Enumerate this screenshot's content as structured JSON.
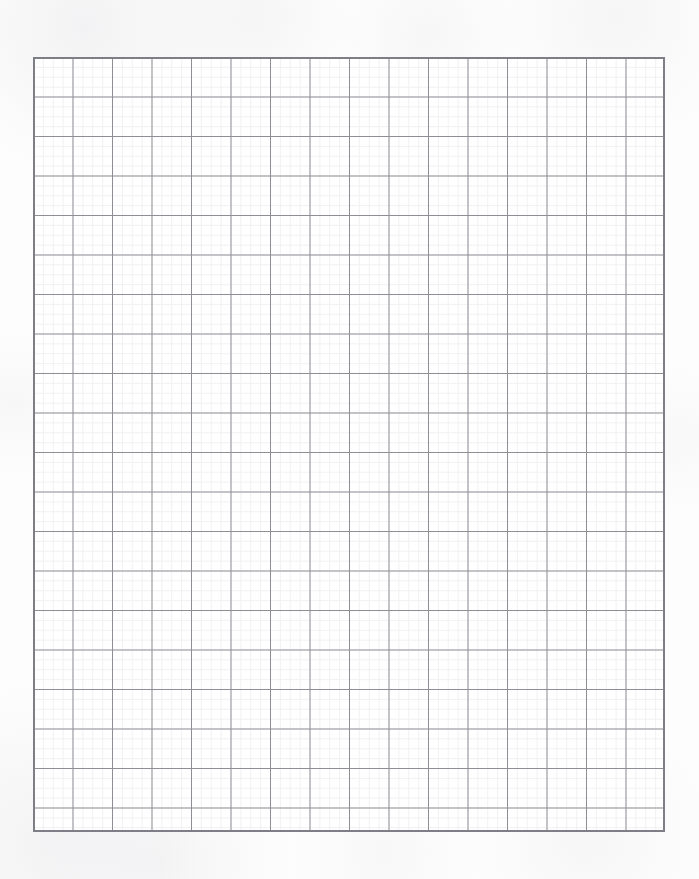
{
  "page": {
    "kind": "graph-paper-scan",
    "width": 699,
    "height": 879,
    "background_color": "#fdfdfd",
    "paper_color": "#ffffff",
    "caption": ""
  },
  "grid": {
    "label": "Graph paper grid",
    "origin_x": 33,
    "origin_y": 57,
    "width": 632,
    "height": 775,
    "major_columns": 16,
    "major_rows": 20,
    "major_cell_px": 39.5,
    "minor_per_major": 4,
    "minor_cell_px": 9.875,
    "major_line_color": "#8d8d94",
    "minor_line_color": "#f1f1f4",
    "border_color": "#7e7e86",
    "major_line_width_px": 1,
    "minor_line_width_px": 1,
    "border_width_px": 2
  },
  "chart_data": {
    "type": "table",
    "title": "",
    "xlabel": "",
    "ylabel": "",
    "categories": [],
    "values": []
  }
}
